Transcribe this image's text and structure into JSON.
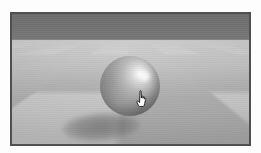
{
  "scene": {
    "title": "3D viewport render",
    "description": "Gray checkerboard floor plane in perspective with a shiny gray sphere resting on it and an elliptical soft shadow; flat gray sky band above the horizon.",
    "sky": {
      "name": "sky-band",
      "color_top": "#6e6e6e",
      "color_bottom": "#787878",
      "horizon_y": 38
    },
    "floor": {
      "name": "checkerboard-floor",
      "pattern": "checkerboard",
      "light_tile_color": "#c9c9c9",
      "dark_tile_color": "#a6a6a6",
      "base_color": "#b6b6b6"
    },
    "sphere": {
      "name": "sphere",
      "material": "glossy-gray",
      "base_color": "#8e8e8e",
      "highlight_color": "#ffffff",
      "shadow_color": "#5a5a5a",
      "center_x": 128,
      "center_y": 85,
      "diameter": 60
    },
    "shadow": {
      "name": "sphere-shadow",
      "color": "#565656",
      "shape": "ellipse"
    },
    "cursor": {
      "name": "hand-cursor",
      "type": "pointing-hand",
      "fill": "#ffffff",
      "outline": "#1c1c1c",
      "x": 138,
      "y": 92
    },
    "frame": {
      "name": "render-frame",
      "border_color": "#4f4f4f",
      "border_width": 2
    }
  }
}
